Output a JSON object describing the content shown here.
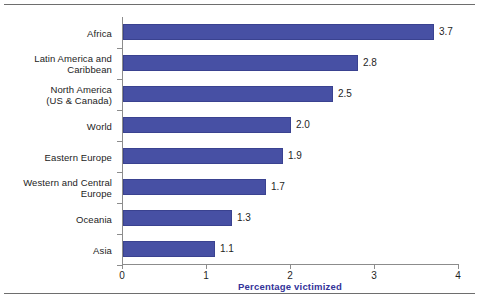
{
  "chart_data": {
    "type": "bar",
    "orientation": "horizontal",
    "title": "",
    "subtitle": "",
    "xlabel": "Percentage victimized",
    "ylabel": "",
    "xlim": [
      0,
      4
    ],
    "ylim": null,
    "grid": false,
    "legend": null,
    "xticks": [
      "0",
      "1",
      "2",
      "3",
      "4"
    ],
    "xtick_values": [
      0,
      1,
      2,
      3,
      4
    ],
    "categories": [
      "Africa",
      "Latin America and\nCaribbean",
      "North America\n(US & Canada)",
      "World",
      "Eastern Europe",
      "Western and Central\nEurope",
      "Oceania",
      "Asia"
    ],
    "values": [
      3.7,
      2.8,
      2.5,
      2.0,
      1.9,
      1.7,
      1.3,
      1.1
    ],
    "value_labels": [
      "3.7",
      "2.8",
      "2.5",
      "2.0",
      "1.9",
      "1.7",
      "1.3",
      "1.1"
    ],
    "bar_color": "#4750a4",
    "bar_edge_color": "#3a4290",
    "axis_color": "#8c8c8c",
    "xlabel_color": "#333399",
    "text_color": "#1f1f1f"
  }
}
